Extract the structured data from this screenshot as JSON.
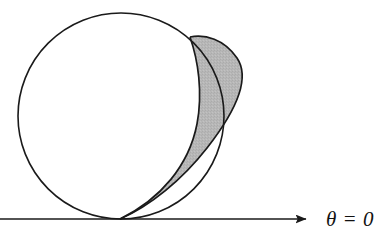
{
  "figure": {
    "type": "geometric-diagram",
    "background_color": "#ffffff",
    "stroke_color": "#1a1a1a",
    "shade_color": "#b7b7b7",
    "axis": {
      "label": "θ = 0",
      "label_text": "θ = 0",
      "direction": "right",
      "y": 219,
      "x_start": 0,
      "x_end": 318,
      "arrowhead": "solid-triangle"
    },
    "circle": {
      "name": "large-circle",
      "center_x": 121,
      "center_y": 116,
      "radius": 103,
      "fill": "none"
    },
    "cusp_point": {
      "x": 120,
      "y": 219
    },
    "intersection_point": {
      "x": 190,
      "y": 37
    },
    "outer_curve": {
      "name": "cardioid-outer-arc",
      "rightmost_x": 259,
      "rightmost_y": 112
    },
    "inner_curve": {
      "name": "cardioid-inner-arc",
      "description": "arc from cusp to intersection point"
    },
    "shaded_region": {
      "name": "shaded-lune",
      "fill": "#b7b7b7",
      "description": "region between inner and outer cardioid arcs"
    }
  }
}
